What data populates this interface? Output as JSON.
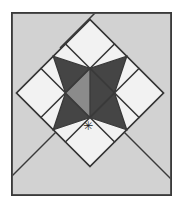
{
  "figure": {
    "name": "quilt-block-diagram",
    "canvas": {
      "width": 183,
      "height": 211
    },
    "background_color": "#ffffff"
  },
  "frame": {
    "name": "outer-frame",
    "x": 11,
    "y": 12,
    "width": 161,
    "height": 184,
    "fill_color": "#d2d2d2",
    "stroke_color": "#3a3a3a",
    "stroke_width": 1.6
  },
  "palette": {
    "background_gray": "#d2d2d2",
    "dark_gray": "#454545",
    "medium_gray": "#8b8b8b",
    "light_white": "#f2f2f2",
    "outline": "#3a3a3a"
  },
  "block": {
    "name": "star-block",
    "rotation_degrees": 45,
    "center_x": 90,
    "center_y": 93,
    "half_diagonal": 74,
    "grid": 3,
    "description": "Nine-patch sawtooth star rotated forty-five degrees",
    "cells": [
      {
        "row": 0,
        "col": 0,
        "type": "square",
        "fill": "light_white",
        "label": "corner-square-top-left"
      },
      {
        "row": 0,
        "col": 1,
        "type": "flying-geese",
        "fill": "dark_gray",
        "ground": "light_white",
        "label": "point-top"
      },
      {
        "row": 0,
        "col": 2,
        "type": "square",
        "fill": "light_white",
        "label": "corner-square-top-right"
      },
      {
        "row": 1,
        "col": 0,
        "type": "flying-geese",
        "fill": "dark_gray",
        "ground": "light_white",
        "label": "point-left"
      },
      {
        "row": 1,
        "col": 1,
        "type": "square",
        "fill": "dark_gray",
        "label": "center-square"
      },
      {
        "row": 1,
        "col": 2,
        "type": "flying-geese",
        "fill": "dark_gray",
        "ground": "light_white",
        "label": "point-right"
      },
      {
        "row": 2,
        "col": 0,
        "type": "square",
        "fill": "light_white",
        "label": "corner-square-bottom-left"
      },
      {
        "row": 2,
        "col": 1,
        "type": "flying-geese",
        "fill": "dark_gray",
        "ground": "light_white",
        "label": "point-bottom"
      },
      {
        "row": 2,
        "col": 2,
        "type": "square",
        "fill": "light_white",
        "label": "corner-square-bottom-right"
      }
    ],
    "accent_patch": {
      "label": "accent-half-square",
      "fill": "medium_gray",
      "position": "lower-center-left"
    }
  },
  "guides": {
    "name": "diagonal-guide-lines",
    "stroke_color": "#3a3a3a",
    "stroke_width": 1.5,
    "lines": [
      {
        "label": "guide-upper-right",
        "x1": 90,
        "y1": 19,
        "x2": 132,
        "y2": 12
      },
      {
        "label": "guide-lower-left",
        "x1": 16,
        "y1": 93,
        "x2": 11,
        "y2": 99
      },
      {
        "label": "guide-lower-right",
        "x1": 90,
        "y1": 167,
        "x2": 163,
        "y2": 196
      }
    ]
  },
  "marker": {
    "name": "asterisk-marker",
    "glyph": "✳",
    "x": 88,
    "y": 126,
    "size": 11,
    "color": "#1b1b1b"
  }
}
